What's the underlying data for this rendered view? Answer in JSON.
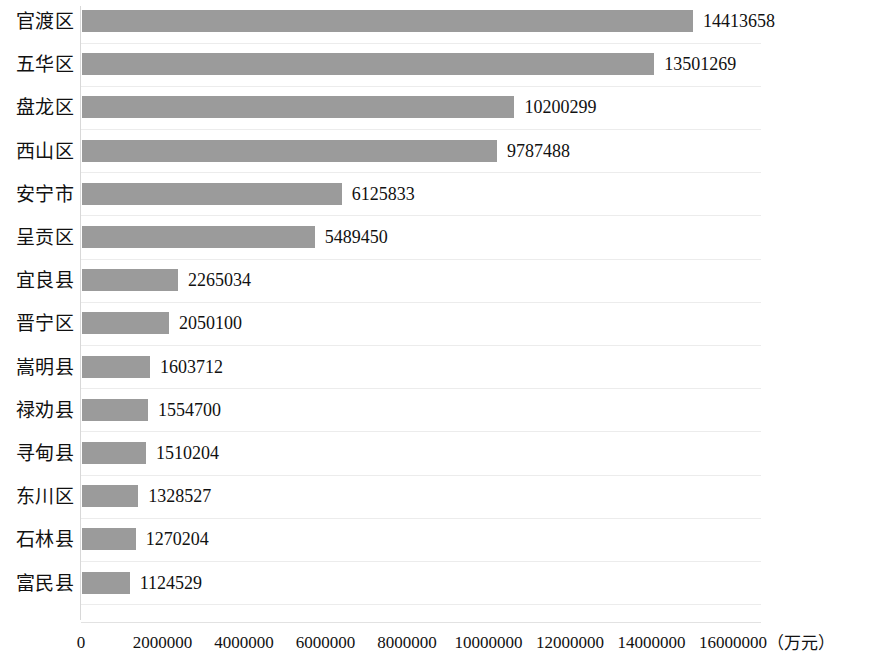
{
  "chart_data": {
    "type": "bar",
    "orientation": "horizontal",
    "title": "",
    "subtitle": "",
    "xlabel": "（万元）",
    "ylabel": "",
    "grid": true,
    "legend": null,
    "xlim": [
      0,
      16000000
    ],
    "xticks": [
      0,
      2000000,
      4000000,
      6000000,
      8000000,
      10000000,
      12000000,
      14000000,
      16000000
    ],
    "xtick_labels": [
      "0",
      "2000000",
      "4000000",
      "6000000",
      "8000000",
      "10000000",
      "12000000",
      "14000000",
      "16000000"
    ],
    "unit_label": "（万元）",
    "bar_color": "#9b9b9b",
    "categories": [
      "官渡区",
      "五华区",
      "盘龙区",
      "西山区",
      "安宁市",
      "呈贡区",
      "宜良县",
      "晋宁区",
      "嵩明县",
      "禄劝县",
      "寻甸县",
      "东川区",
      "石林县",
      "富民县"
    ],
    "values": [
      14413658,
      13501269,
      10200299,
      9787488,
      6125833,
      5489450,
      2265034,
      2050100,
      1603712,
      1554700,
      1510204,
      1328527,
      1270204,
      1124529
    ],
    "value_labels": [
      "14413658",
      "13501269",
      "10200299",
      "9787488",
      "6125833",
      "5489450",
      "2265034",
      "2050100",
      "1603712",
      "1554700",
      "1510204",
      "1328527",
      "1270204",
      "1124529"
    ]
  }
}
